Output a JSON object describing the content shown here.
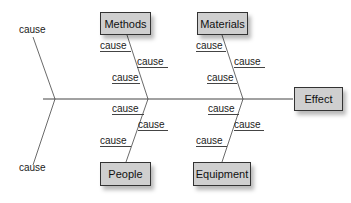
{
  "effect": {
    "label": "Effect"
  },
  "categories": {
    "methods": {
      "label": "Methods"
    },
    "materials": {
      "label": "Materials"
    },
    "people": {
      "label": "People"
    },
    "equipment": {
      "label": "Equipment"
    }
  },
  "causes": {
    "top_left": "cause",
    "bottom_left": "cause",
    "methods": [
      "cause",
      "cause",
      "cause"
    ],
    "materials": [
      "cause",
      "cause",
      "cause"
    ],
    "people": [
      "cause",
      "cause",
      "cause"
    ],
    "equipment": [
      "cause",
      "cause",
      "cause"
    ]
  },
  "colors": {
    "box_fill": "#cfcfcf",
    "box_border": "#333333",
    "line": "#444444"
  }
}
